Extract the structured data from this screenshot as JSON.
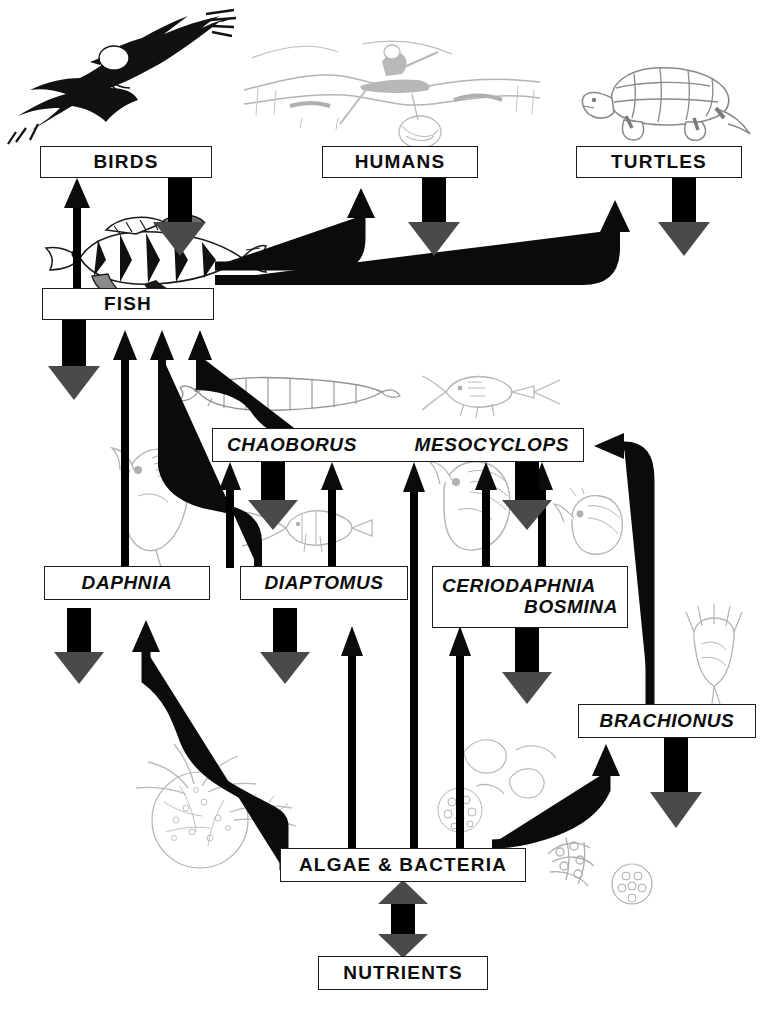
{
  "diagram": {
    "type": "food-web",
    "nodes": [
      {
        "id": "birds",
        "label": "BIRDS",
        "style": "upright"
      },
      {
        "id": "humans",
        "label": "HUMANS",
        "style": "upright"
      },
      {
        "id": "turtles",
        "label": "TURTLES",
        "style": "upright"
      },
      {
        "id": "fish",
        "label": "FISH",
        "style": "upright"
      },
      {
        "id": "chaoborus",
        "label": "CHAOBORUS",
        "style": "italic"
      },
      {
        "id": "mesocyclops",
        "label": "MESOCYCLOPS",
        "style": "italic"
      },
      {
        "id": "daphnia",
        "label": "DAPHNIA",
        "style": "italic"
      },
      {
        "id": "diaptomus",
        "label": "DIAPTOMUS",
        "style": "italic"
      },
      {
        "id": "ceriodaphnia",
        "label": "CERIODAPHNIA",
        "style": "italic"
      },
      {
        "id": "bosmina",
        "label": "BOSMINA",
        "style": "italic"
      },
      {
        "id": "brachionus",
        "label": "BRACHIONUS",
        "style": "italic"
      },
      {
        "id": "algae",
        "label": "ALGAE & BACTERIA",
        "style": "upright"
      },
      {
        "id": "nutrients",
        "label": "NUTRIENTS",
        "style": "upright"
      }
    ],
    "illustrations": [
      {
        "id": "eagle",
        "caption": "bald eagle in flight"
      },
      {
        "id": "boat",
        "caption": "person fishing from a boat on water"
      },
      {
        "id": "turtle",
        "caption": "snapping turtle"
      },
      {
        "id": "perch",
        "caption": "yellow perch"
      },
      {
        "id": "larva",
        "caption": "Chaoborus phantom midge larva"
      },
      {
        "id": "copepod-meso",
        "caption": "Mesocyclops copepod"
      },
      {
        "id": "daphnia-ill",
        "caption": "Daphnia water flea"
      },
      {
        "id": "diaptomus-ill",
        "caption": "Diaptomus copepod"
      },
      {
        "id": "cerio-ill",
        "caption": "Ceriodaphnia"
      },
      {
        "id": "bosmina-ill",
        "caption": "Bosmina"
      },
      {
        "id": "rotifer-ill",
        "caption": "Brachionus rotifer"
      },
      {
        "id": "algae-colony",
        "caption": "algae colony and filaments"
      },
      {
        "id": "algae-cluster",
        "caption": "algae cells and bacteria"
      }
    ],
    "arrow_legend": {
      "thin_black": "consumption / energy flow",
      "thick_gray": "nutrient excretion and recycling"
    },
    "edges": [
      {
        "from": "fish",
        "to": "birds",
        "kind": "consumption"
      },
      {
        "from": "fish",
        "to": "humans",
        "kind": "consumption"
      },
      {
        "from": "fish",
        "to": "turtles",
        "kind": "consumption"
      },
      {
        "from": "daphnia",
        "to": "fish",
        "kind": "consumption"
      },
      {
        "from": "diaptomus",
        "to": "fish",
        "kind": "consumption"
      },
      {
        "from": "chaoborus",
        "to": "fish",
        "kind": "consumption"
      },
      {
        "from": "daphnia",
        "to": "chaoborus",
        "kind": "consumption"
      },
      {
        "from": "diaptomus",
        "to": "chaoborus",
        "kind": "consumption"
      },
      {
        "from": "ceriodaphnia",
        "to": "mesocyclops",
        "kind": "consumption"
      },
      {
        "from": "brachionus",
        "to": "mesocyclops",
        "kind": "consumption"
      },
      {
        "from": "algae",
        "to": "chaoborus",
        "kind": "consumption"
      },
      {
        "from": "algae",
        "to": "daphnia",
        "kind": "consumption"
      },
      {
        "from": "algae",
        "to": "diaptomus",
        "kind": "consumption"
      },
      {
        "from": "algae",
        "to": "ceriodaphnia",
        "kind": "consumption"
      },
      {
        "from": "algae",
        "to": "brachionus",
        "kind": "consumption"
      },
      {
        "from": "nutrients",
        "to": "algae",
        "kind": "recycling"
      },
      {
        "from": "algae",
        "to": "nutrients",
        "kind": "recycling"
      },
      {
        "from": "birds",
        "to": "nutrients",
        "kind": "excretion"
      },
      {
        "from": "humans",
        "to": "nutrients",
        "kind": "excretion"
      },
      {
        "from": "turtles",
        "to": "nutrients",
        "kind": "excretion"
      },
      {
        "from": "fish",
        "to": "nutrients",
        "kind": "excretion"
      },
      {
        "from": "chaoborus",
        "to": "nutrients",
        "kind": "excretion"
      },
      {
        "from": "mesocyclops",
        "to": "nutrients",
        "kind": "excretion"
      },
      {
        "from": "daphnia",
        "to": "nutrients",
        "kind": "excretion"
      },
      {
        "from": "diaptomus",
        "to": "nutrients",
        "kind": "excretion"
      },
      {
        "from": "ceriodaphnia",
        "to": "nutrients",
        "kind": "excretion"
      },
      {
        "from": "brachionus",
        "to": "nutrients",
        "kind": "excretion"
      }
    ]
  },
  "colors": {
    "ink": "#0d0d0d",
    "background": "#ffffff",
    "thin_arrow": "#0b0b0b",
    "thick_arrow": "#4a4a4a"
  }
}
